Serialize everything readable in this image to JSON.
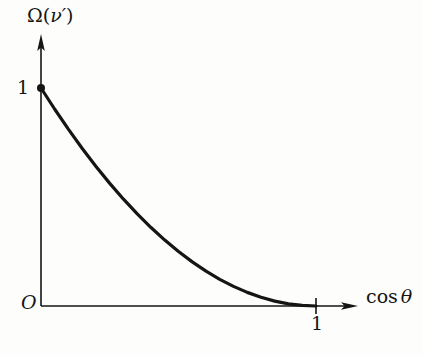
{
  "figure": {
    "background_color": "#fdfdfc",
    "ink_color": "#151515",
    "width": 423,
    "height": 355
  },
  "axes": {
    "origin_label": "O",
    "y_axis": {
      "label_omega": "Ω",
      "label_open_paren": "(",
      "label_nu": "ν",
      "label_prime": "′",
      "label_close_paren": ")",
      "label_full": "Ω(ν′)",
      "tick_labels": [
        "1"
      ],
      "tick_one": "1"
    },
    "x_axis": {
      "label_fn": "cos",
      "label_theta": "θ",
      "label_full": "cos θ",
      "tick_labels": [
        "1"
      ],
      "tick_one": "1"
    }
  },
  "chart_data": {
    "type": "line",
    "title": "",
    "xlabel": "cos θ",
    "ylabel": "Ω(ν′)",
    "xlim": [
      0,
      1.18
    ],
    "ylim": [
      0,
      1.18
    ],
    "grid": false,
    "legend": null,
    "x_ticks": [
      1
    ],
    "y_ticks": [
      1
    ],
    "x_tick_labels": [
      "1"
    ],
    "y_tick_labels": [
      "1"
    ],
    "origin_label": "O",
    "axis_arrows": true,
    "series": [
      {
        "name": "Ω(ν′)",
        "line_color": "#151515",
        "line_width": 3.2,
        "x": [
          0.0,
          0.05,
          0.1,
          0.15,
          0.2,
          0.25,
          0.3,
          0.35,
          0.4,
          0.45,
          0.5,
          0.55,
          0.6,
          0.65,
          0.7,
          0.75,
          0.8,
          0.85,
          0.9,
          0.95,
          1.0
        ],
        "values": [
          1.0,
          0.9025,
          0.81,
          0.7225,
          0.64,
          0.5625,
          0.49,
          0.4225,
          0.36,
          0.3025,
          0.25,
          0.2025,
          0.16,
          0.1225,
          0.09,
          0.0625,
          0.04,
          0.0225,
          0.01,
          0.0025,
          0.0
        ]
      }
    ],
    "markers": [
      {
        "name": "endpoint-dot",
        "x": 0.0,
        "y": 1.0,
        "shape": "filled-circle",
        "radius_px": 4,
        "color": "#151515"
      }
    ]
  }
}
